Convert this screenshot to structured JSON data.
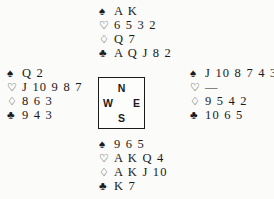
{
  "diagram": {
    "type": "bridge-deal-diagram",
    "suit_symbols": {
      "spade": "♠",
      "heart": "♡",
      "diamond": "♢",
      "club": "♣"
    },
    "compass": {
      "north": "N",
      "east": "E",
      "south": "S",
      "west": "W"
    },
    "hands": {
      "north": {
        "label": "North",
        "spades": "A K",
        "hearts": "6 5 3 2",
        "diamonds": "Q 7",
        "clubs": "A Q J 8 2"
      },
      "west": {
        "label": "West",
        "spades": "Q 2",
        "hearts": "J 10 9 8 7",
        "diamonds": "8 6 3",
        "clubs": "9 4 3"
      },
      "east": {
        "label": "East",
        "spades": "J 10 8 7 4 3",
        "hearts": "—",
        "diamonds": "9 5 4 2",
        "clubs": "10 6 5"
      },
      "south": {
        "label": "South",
        "spades": "9 6 5",
        "hearts": "A K Q 4",
        "diamonds": "A K J 10",
        "clubs": "K 7"
      }
    },
    "colors": {
      "ink": "#1a1a1a",
      "paper": "#fbfbfa"
    }
  }
}
